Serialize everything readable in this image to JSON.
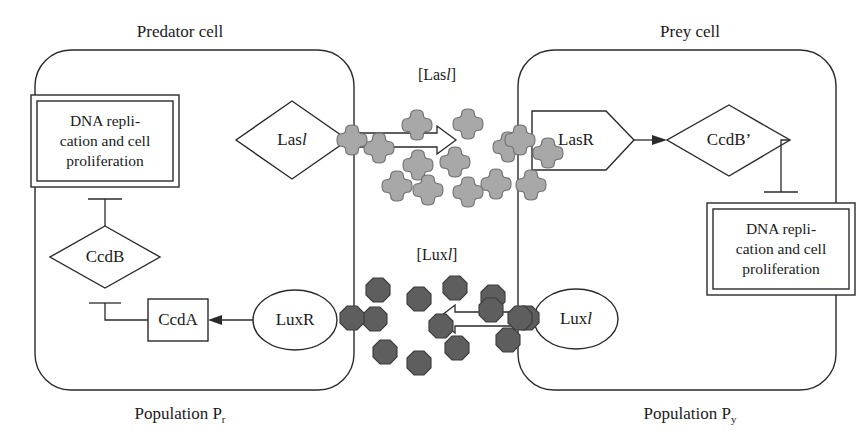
{
  "figure": {
    "type": "biological-signaling-diagram",
    "title_left": "Predator cell",
    "title_right": "Prey cell",
    "population_left": "Population P",
    "population_left_sub": "r",
    "population_right": "Population P",
    "population_right_sub": "y",
    "concentration_top_prefix": "[Las",
    "concentration_top_italic": "l",
    "concentration_top_suffix": "]",
    "concentration_bottom_prefix": "[Lux",
    "concentration_bottom_italic": "l",
    "concentration_bottom_suffix": "]"
  },
  "colors": {
    "line": "#2a2a2a",
    "page_background": "#ffffff",
    "shape_fill": "#ffffff",
    "las_molecule_fill": "#a8a8a8",
    "las_molecule_stroke": "#6f6f6f",
    "lux_molecule_fill": "#5e5e5e",
    "lux_molecule_stroke": "#3b3b3b",
    "text": "#1a1a1a"
  },
  "predator_cell": {
    "dna_box": {
      "line1": "DNA repli-",
      "line2": "cation and cell",
      "line3": "proliferation"
    },
    "nodes": [
      {
        "id": "lasI",
        "label_prefix": "Las",
        "label_italic": "l",
        "shape": "diamond"
      },
      {
        "id": "ccdB",
        "label_prefix": "CcdB",
        "label_italic": "",
        "shape": "diamond"
      },
      {
        "id": "ccdA",
        "label_prefix": "CcdA",
        "label_italic": "",
        "shape": "rectangle"
      },
      {
        "id": "luxR",
        "label_prefix": "LuxR",
        "label_italic": "",
        "shape": "ellipse"
      }
    ],
    "edges": [
      {
        "from": "ccdB",
        "to": "dna_box",
        "kind": "inhibition"
      },
      {
        "from": "ccdA",
        "to": "ccdB",
        "kind": "inhibition"
      },
      {
        "from": "luxR",
        "to": "ccdA",
        "kind": "activation"
      },
      {
        "from": "lasI",
        "to": "lasI_pool",
        "kind": "secretion"
      }
    ]
  },
  "prey_cell": {
    "dna_box": {
      "line1": "DNA repli-",
      "line2": "cation and cell",
      "line3": "proliferation"
    },
    "nodes": [
      {
        "id": "lasR",
        "label_prefix": "LasR",
        "label_italic": "",
        "shape": "pentagon"
      },
      {
        "id": "ccdBp",
        "label_prefix": "CcdB’",
        "label_italic": "",
        "shape": "diamond"
      },
      {
        "id": "luxI",
        "label_prefix": "Lux",
        "label_italic": "l",
        "shape": "ellipse"
      }
    ],
    "edges": [
      {
        "from": "lasR",
        "to": "ccdBp",
        "kind": "activation"
      },
      {
        "from": "ccdBp",
        "to": "dna_box",
        "kind": "inhibition"
      },
      {
        "from": "luxI",
        "to": "luxI_pool",
        "kind": "secretion"
      }
    ]
  },
  "molecules": {
    "lasI_pool": {
      "shape": "cross",
      "count": 12,
      "points": [
        [
          379,
          148
        ],
        [
          417,
          125
        ],
        [
          468,
          124
        ],
        [
          508,
          147
        ],
        [
          455,
          162
        ],
        [
          548,
          153
        ],
        [
          418,
          165
        ],
        [
          397,
          186
        ],
        [
          428,
          190
        ],
        [
          496,
          184
        ],
        [
          531,
          185
        ],
        [
          468,
          192
        ]
      ],
      "membrane_points": [
        [
          352,
          140
        ],
        [
          520,
          140
        ]
      ]
    },
    "luxI_pool": {
      "shape": "octagon",
      "count": 12,
      "points": [
        [
          378,
          290
        ],
        [
          419,
          299
        ],
        [
          455,
          288
        ],
        [
          493,
          297
        ],
        [
          375,
          319
        ],
        [
          441,
          326
        ],
        [
          491,
          310
        ],
        [
          385,
          352
        ],
        [
          419,
          363
        ],
        [
          457,
          348
        ],
        [
          508,
          340
        ],
        [
          527,
          318
        ]
      ],
      "membrane_points": [
        [
          352,
          318
        ],
        [
          520,
          318
        ]
      ]
    }
  }
}
